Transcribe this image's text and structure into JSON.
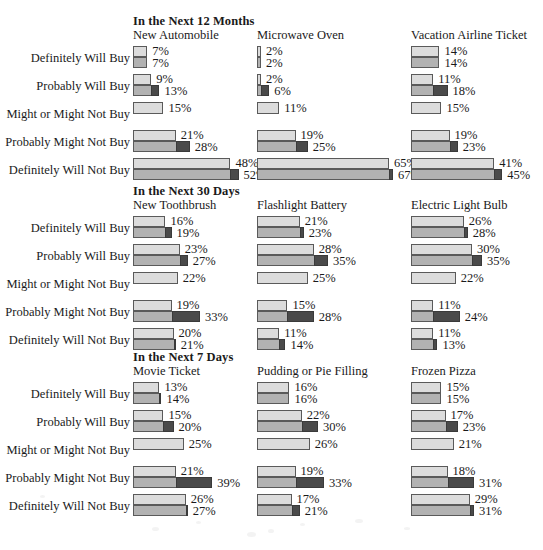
{
  "figure": {
    "row_labels": [
      "Definitely Will Buy",
      "Probably Will Buy",
      "Might or Might Not Buy",
      "Probably Might Not Buy",
      "Definitely Will Not Buy"
    ],
    "sections": [
      {
        "title": "In the Next 12 Months",
        "columns": [
          {
            "name": "New Automobile",
            "rows": [
              {
                "label": "Definitely Will Buy",
                "top": 7,
                "bottom": 7,
                "top_text": "7%",
                "bottom_text": "7%"
              },
              {
                "label": "Probably Will Buy",
                "top": 9,
                "bottom": 13,
                "top_text": "9%",
                "bottom_text": "13%"
              },
              {
                "label": "Might or Might Not Buy",
                "top": 15,
                "bottom": null,
                "top_text": "15%",
                "bottom_text": null
              },
              {
                "label": "Probably Might Not Buy",
                "top": 21,
                "bottom": 28,
                "top_text": "21%",
                "bottom_text": "28%"
              },
              {
                "label": "Definitely Will Not Buy",
                "top": 48,
                "bottom": 52,
                "top_text": "48%",
                "bottom_text": "52%"
              }
            ]
          },
          {
            "name": "Microwave Oven",
            "rows": [
              {
                "label": "Definitely Will Buy",
                "top": 2,
                "bottom": 2,
                "top_text": "2%",
                "bottom_text": "2%"
              },
              {
                "label": "Probably Will Buy",
                "top": 2,
                "bottom": 6,
                "top_text": "2%",
                "bottom_text": "6%"
              },
              {
                "label": "Might or Might Not Buy",
                "top": 11,
                "bottom": null,
                "top_text": "11%",
                "bottom_text": null
              },
              {
                "label": "Probably Might Not Buy",
                "top": 19,
                "bottom": 25,
                "top_text": "19%",
                "bottom_text": "25%"
              },
              {
                "label": "Definitely Will Not Buy",
                "top": 65,
                "bottom": 67,
                "top_text": "65%",
                "bottom_text": "67%"
              }
            ]
          },
          {
            "name": "Vacation Airline Ticket",
            "rows": [
              {
                "label": "Definitely Will Buy",
                "top": 14,
                "bottom": 14,
                "top_text": "14%",
                "bottom_text": "14%"
              },
              {
                "label": "Probably Will Buy",
                "top": 11,
                "bottom": 18,
                "top_text": "11%",
                "bottom_text": "18%"
              },
              {
                "label": "Might or Might Not Buy",
                "top": 15,
                "bottom": null,
                "top_text": "15%",
                "bottom_text": null
              },
              {
                "label": "Probably Might Not Buy",
                "top": 19,
                "bottom": 23,
                "top_text": "19%",
                "bottom_text": "23%"
              },
              {
                "label": "Definitely Will Not Buy",
                "top": 41,
                "bottom": 45,
                "top_text": "41%",
                "bottom_text": "45%"
              }
            ]
          }
        ]
      },
      {
        "title": "In the Next 30 Days",
        "columns": [
          {
            "name": "New Toothbrush",
            "rows": [
              {
                "label": "Definitely Will Buy",
                "top": 16,
                "bottom": 19,
                "top_text": "16%",
                "bottom_text": "19%"
              },
              {
                "label": "Probably Will Buy",
                "top": 23,
                "bottom": 27,
                "top_text": "23%",
                "bottom_text": "27%"
              },
              {
                "label": "Might or Might Not Buy",
                "top": 22,
                "bottom": null,
                "top_text": "22%",
                "bottom_text": null
              },
              {
                "label": "Probably Might Not Buy",
                "top": 19,
                "bottom": 33,
                "top_text": "19%",
                "bottom_text": "33%"
              },
              {
                "label": "Definitely Will Not Buy",
                "top": 20,
                "bottom": 21,
                "top_text": "20%",
                "bottom_text": "21%"
              }
            ]
          },
          {
            "name": "Flashlight Battery",
            "rows": [
              {
                "label": "Definitely Will Buy",
                "top": 21,
                "bottom": 23,
                "top_text": "21%",
                "bottom_text": "23%"
              },
              {
                "label": "Probably Will Buy",
                "top": 28,
                "bottom": 35,
                "top_text": "28%",
                "bottom_text": "35%"
              },
              {
                "label": "Might or Might Not Buy",
                "top": 25,
                "bottom": null,
                "top_text": "25%",
                "bottom_text": null
              },
              {
                "label": "Probably Might Not Buy",
                "top": 15,
                "bottom": 28,
                "top_text": "15%",
                "bottom_text": "28%"
              },
              {
                "label": "Definitely Will Not Buy",
                "top": 11,
                "bottom": 14,
                "top_text": "11%",
                "bottom_text": "14%"
              }
            ]
          },
          {
            "name": "Electric Light Bulb",
            "rows": [
              {
                "label": "Definitely Will Buy",
                "top": 26,
                "bottom": 28,
                "top_text": "26%",
                "bottom_text": "28%"
              },
              {
                "label": "Probably Will Buy",
                "top": 30,
                "bottom": 35,
                "top_text": "30%",
                "bottom_text": "35%"
              },
              {
                "label": "Might or Might Not Buy",
                "top": 22,
                "bottom": null,
                "top_text": "22%",
                "bottom_text": null
              },
              {
                "label": "Probably Might Not Buy",
                "top": 11,
                "bottom": 24,
                "top_text": "11%",
                "bottom_text": "24%"
              },
              {
                "label": "Definitely Will Not Buy",
                "top": 11,
                "bottom": 13,
                "top_text": "11%",
                "bottom_text": "13%"
              }
            ]
          }
        ]
      },
      {
        "title": "In the Next 7 Days",
        "columns": [
          {
            "name": "Movie Ticket",
            "rows": [
              {
                "label": "Definitely Will Buy",
                "top": 13,
                "bottom": 14,
                "top_text": "13%",
                "bottom_text": "14%"
              },
              {
                "label": "Probably Will Buy",
                "top": 15,
                "bottom": 20,
                "top_text": "15%",
                "bottom_text": "20%"
              },
              {
                "label": "Might or Might Not Buy",
                "top": 25,
                "bottom": null,
                "top_text": "25%",
                "bottom_text": null
              },
              {
                "label": "Probably Might Not Buy",
                "top": 21,
                "bottom": 39,
                "top_text": "21%",
                "bottom_text": "39%"
              },
              {
                "label": "Definitely Will Not Buy",
                "top": 26,
                "bottom": 27,
                "top_text": "26%",
                "bottom_text": "27%"
              }
            ]
          },
          {
            "name": "Pudding or Pie Filling",
            "rows": [
              {
                "label": "Definitely Will Buy",
                "top": 16,
                "bottom": 16,
                "top_text": "16%",
                "bottom_text": "16%"
              },
              {
                "label": "Probably Will Buy",
                "top": 22,
                "bottom": 30,
                "top_text": "22%",
                "bottom_text": "30%"
              },
              {
                "label": "Might or Might Not Buy",
                "top": 26,
                "bottom": null,
                "top_text": "26%",
                "bottom_text": null
              },
              {
                "label": "Probably Might Not Buy",
                "top": 19,
                "bottom": 33,
                "top_text": "19%",
                "bottom_text": "33%"
              },
              {
                "label": "Definitely Will Not Buy",
                "top": 17,
                "bottom": 21,
                "top_text": "17%",
                "bottom_text": "21%"
              }
            ]
          },
          {
            "name": "Frozen Pizza",
            "rows": [
              {
                "label": "Definitely Will Buy",
                "top": 15,
                "bottom": 15,
                "top_text": "15%",
                "bottom_text": "15%"
              },
              {
                "label": "Probably Will Buy",
                "top": 17,
                "bottom": 23,
                "top_text": "17%",
                "bottom_text": "23%"
              },
              {
                "label": "Might or Might Not Buy",
                "top": 21,
                "bottom": null,
                "top_text": "21%",
                "bottom_text": null
              },
              {
                "label": "Probably Might Not Buy",
                "top": 18,
                "bottom": 31,
                "top_text": "18%",
                "bottom_text": "31%"
              },
              {
                "label": "Definitely Will Not Buy",
                "top": 29,
                "bottom": 31,
                "top_text": "29%",
                "bottom_text": "31%"
              }
            ]
          }
        ]
      }
    ]
  },
  "chart_data": {
    "type": "bar",
    "orientation": "horizontal",
    "xlabel": "",
    "ylabel": "",
    "xlim": [
      0,
      70
    ],
    "grid": false,
    "legend_position": "none",
    "units": "percent",
    "categories": [
      "Definitely Will Buy",
      "Probably Will Buy",
      "Might or Might Not Buy",
      "Probably Might Not Buy",
      "Definitely Will Not Buy"
    ],
    "series": [
      {
        "name": "In the Next 12 Months / New Automobile / top",
        "values": [
          7,
          9,
          15,
          21,
          48
        ]
      },
      {
        "name": "In the Next 12 Months / New Automobile / bottom",
        "values": [
          7,
          13,
          null,
          28,
          52
        ]
      },
      {
        "name": "In the Next 12 Months / Microwave Oven / top",
        "values": [
          2,
          2,
          11,
          19,
          65
        ]
      },
      {
        "name": "In the Next 12 Months / Microwave Oven / bottom",
        "values": [
          2,
          6,
          null,
          25,
          67
        ]
      },
      {
        "name": "In the Next 12 Months / Vacation Airline Ticket / top",
        "values": [
          14,
          11,
          15,
          19,
          41
        ]
      },
      {
        "name": "In the Next 12 Months / Vacation Airline Ticket / bottom",
        "values": [
          14,
          18,
          null,
          23,
          45
        ]
      },
      {
        "name": "In the Next 30 Days / New Toothbrush / top",
        "values": [
          16,
          23,
          22,
          19,
          20
        ]
      },
      {
        "name": "In the Next 30 Days / New Toothbrush / bottom",
        "values": [
          19,
          27,
          null,
          33,
          21
        ]
      },
      {
        "name": "In the Next 30 Days / Flashlight Battery / top",
        "values": [
          21,
          28,
          25,
          15,
          11
        ]
      },
      {
        "name": "In the Next 30 Days / Flashlight Battery / bottom",
        "values": [
          23,
          35,
          null,
          28,
          14
        ]
      },
      {
        "name": "In the Next 30 Days / Electric Light Bulb / top",
        "values": [
          26,
          30,
          22,
          11,
          11
        ]
      },
      {
        "name": "In the Next 30 Days / Electric Light Bulb / bottom",
        "values": [
          28,
          35,
          null,
          24,
          13
        ]
      },
      {
        "name": "In the Next 7 Days / Movie Ticket / top",
        "values": [
          13,
          15,
          25,
          21,
          26
        ]
      },
      {
        "name": "In the Next 7 Days / Movie Ticket / bottom",
        "values": [
          14,
          20,
          null,
          39,
          27
        ]
      },
      {
        "name": "In the Next 7 Days / Pudding or Pie Filling / top",
        "values": [
          16,
          22,
          26,
          19,
          17
        ]
      },
      {
        "name": "In the Next 7 Days / Pudding or Pie Filling / bottom",
        "values": [
          16,
          30,
          null,
          33,
          21
        ]
      },
      {
        "name": "In the Next 7 Days / Frozen Pizza / top",
        "values": [
          15,
          17,
          21,
          18,
          29
        ]
      },
      {
        "name": "In the Next 7 Days / Frozen Pizza / bottom",
        "values": [
          15,
          23,
          null,
          31,
          31
        ]
      }
    ]
  },
  "style": {
    "bar_light": "#dcdcdc",
    "bar_medium": "#b2b2b2",
    "bar_dark": "#4a4a4a",
    "border": "#5a5a5a",
    "text": "#1a1a1a",
    "background": "#ffffff"
  },
  "layout": {
    "px_per_percent": 2.03,
    "column_x": [
      133,
      257,
      411
    ],
    "section_y": [
      14,
      184,
      350
    ],
    "row_step": 28,
    "rows_start_offset": 32
  }
}
